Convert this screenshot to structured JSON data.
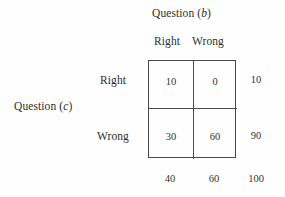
{
  "figure": {
    "type": "contingency-table",
    "column_group_label": "Question (",
    "column_group_var": "b",
    "column_group_close": ")",
    "row_group_label": "Question (",
    "row_group_var": "c",
    "row_group_close": ")"
  },
  "columns": {
    "headers": [
      "Right",
      "Wrong"
    ]
  },
  "rows": {
    "headers": [
      "Right",
      "Wrong"
    ]
  },
  "cells": {
    "r0c0": "10",
    "r0c1": "0",
    "r1c0": "30",
    "r1c1": "60"
  },
  "row_totals": [
    "10",
    "90"
  ],
  "col_totals": [
    "40",
    "60"
  ],
  "grand_total": "100",
  "chart_data": {
    "type": "table",
    "xlabel": "Question (b)",
    "ylabel": "Question (c)",
    "categories": [
      "Right",
      "Wrong"
    ],
    "row_categories": [
      "Right",
      "Wrong"
    ],
    "matrix": [
      [
        10,
        0
      ],
      [
        30,
        60
      ]
    ],
    "row_totals": [
      10,
      90
    ],
    "col_totals": [
      40,
      60
    ],
    "grand_total": 100,
    "grid": true,
    "legend": "none"
  },
  "style": {
    "border_color": "#4a4a4a",
    "text_color": "#2f2f2f",
    "background": "#fefefe"
  }
}
